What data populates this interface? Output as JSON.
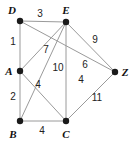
{
  "figure": {
    "width": 133,
    "height": 142,
    "background_color": "#ffffff",
    "edge_color": "#9a9a9a",
    "vertex_color": "#1a1a1a",
    "label_color": "#222222"
  },
  "chart_data": {
    "type": "diagram",
    "title": "",
    "nodes": [
      {
        "id": "D",
        "label": "D",
        "x": 20,
        "y": 21,
        "label_x": 12,
        "label_y": 10
      },
      {
        "id": "E",
        "label": "E",
        "x": 66,
        "y": 22,
        "label_x": 66,
        "label_y": 10
      },
      {
        "id": "A",
        "label": "A",
        "x": 20,
        "y": 71,
        "label_x": 9,
        "label_y": 71
      },
      {
        "id": "B",
        "label": "B",
        "x": 20,
        "y": 121,
        "label_x": 13,
        "label_y": 134
      },
      {
        "id": "C",
        "label": "C",
        "x": 66,
        "y": 121,
        "label_x": 66,
        "label_y": 134
      },
      {
        "id": "Z",
        "label": "Z",
        "x": 115,
        "y": 72,
        "label_x": 125,
        "label_y": 72
      }
    ],
    "edges": [
      {
        "from": "D",
        "to": "E",
        "weight": "3",
        "label_x": 40,
        "label_y": 14
      },
      {
        "from": "D",
        "to": "A",
        "weight": "1",
        "label_x": 13,
        "label_y": 42
      },
      {
        "from": "A",
        "to": "B",
        "weight": "2",
        "label_x": 13,
        "label_y": 97
      },
      {
        "from": "B",
        "to": "C",
        "weight": "4",
        "label_x": 42,
        "label_y": 131
      },
      {
        "from": "E",
        "to": "C",
        "weight": "10",
        "label_x": 58,
        "label_y": 68
      },
      {
        "from": "A",
        "to": "E",
        "weight": "7",
        "label_x": 46,
        "label_y": 50
      },
      {
        "from": "B",
        "to": "E",
        "weight": "4",
        "label_x": 38,
        "label_y": 85
      },
      {
        "from": "A",
        "to": "C",
        "weight": "4",
        "label_x": 81,
        "label_y": 80
      },
      {
        "from": "D",
        "to": "Z",
        "weight": "9",
        "label_x": 95,
        "label_y": 40
      },
      {
        "from": "E",
        "to": "Z",
        "weight": "6",
        "label_x": 85,
        "label_y": 65
      },
      {
        "from": "C",
        "to": "Z",
        "weight": "11",
        "label_x": 97,
        "label_y": 98
      }
    ]
  }
}
